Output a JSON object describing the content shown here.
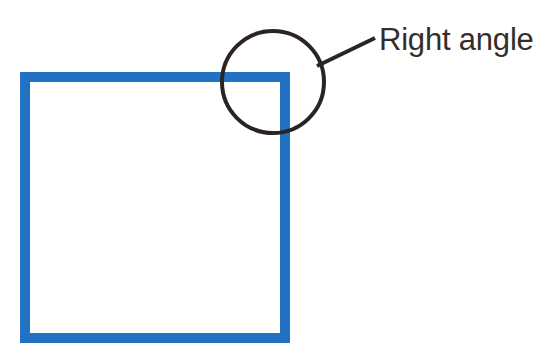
{
  "figure": {
    "kind": "geometry-diagram",
    "background_color": "#ffffff",
    "title_text": "",
    "shapes": {
      "square": {
        "name": "blue-square",
        "label": "square",
        "stroke_color": "#2272c4",
        "stroke_width": 10,
        "x": 25,
        "y": 77,
        "width": 260,
        "height": 261
      },
      "highlight_circle": {
        "name": "highlight-circle",
        "label": "circle highlighting the top-right corner",
        "stroke_color": "#2b2422",
        "stroke_width": 4,
        "center_x": 273,
        "center_y": 82,
        "radius": 51
      },
      "leader_line": {
        "name": "leader-line",
        "label": "callout leader line",
        "stroke_color": "#2b2422",
        "stroke_width": 4,
        "x1": 317,
        "y1": 66,
        "x2": 375,
        "y2": 38
      }
    },
    "annotation": {
      "text": "Right angle",
      "color": "#332e2c",
      "font_size": 31,
      "x": 379,
      "baseline_y": 50
    }
  }
}
